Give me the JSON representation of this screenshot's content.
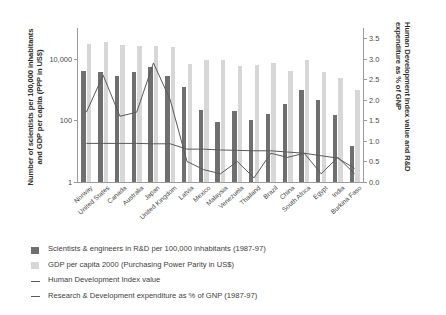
{
  "chart_data": {
    "type": "bar",
    "title": "",
    "xlabel": "",
    "ylabel": "Number of scientists per 100,000 inhabitants and GDP per capita (PPP in US$)",
    "ylabel_right": "Human Development Index value and R&D expenditure as % of GNP",
    "yscale": "log",
    "ylim": [
      1,
      100000
    ],
    "yticks": [
      "1",
      "100",
      "10,000"
    ],
    "ylim_right": [
      0.0,
      3.75
    ],
    "yticks_right": [
      "0.0",
      "0.5",
      "1.0",
      "1.5",
      "2.0",
      "2.5",
      "3.0",
      "3.5"
    ],
    "grid": false,
    "legend_position": "below",
    "categories": [
      "Norway",
      "United States",
      "Canada",
      "Australia",
      "Japan",
      "United Kingdom",
      "Latvia",
      "Mexico",
      "Malaysia",
      "Venezuela",
      "Thailand",
      "Brazil",
      "China",
      "South Africa",
      "Egypt",
      "India",
      "Burkina Faso"
    ],
    "series": [
      {
        "name": "Scientists & engineers in R&D per 100,000 inhabitants (1987-97)",
        "type": "bar",
        "color": "#6f6f6f",
        "axis": "left",
        "values": [
          4100,
          3700,
          2700,
          3600,
          5300,
          2700,
          1200,
          215,
          90,
          200,
          100,
          165,
          350,
          1000,
          460,
          150,
          15
        ]
      },
      {
        "name": "GDP per capita 2000 (Purchasing Power Parity in US$)",
        "type": "bar",
        "color": "#d7d7d7",
        "axis": "left",
        "values": [
          29600,
          34100,
          27800,
          25700,
          26800,
          23500,
          7000,
          9000,
          9000,
          5800,
          6400,
          7300,
          3900,
          9400,
          3600,
          2400,
          1000
        ]
      },
      {
        "name": "Human Development Index value",
        "type": "line",
        "color": "#5a5a5a",
        "axis": "right",
        "values": [
          0.94,
          0.94,
          0.94,
          0.94,
          0.93,
          0.93,
          0.8,
          0.8,
          0.78,
          0.77,
          0.76,
          0.76,
          0.73,
          0.7,
          0.64,
          0.58,
          0.33
        ]
      },
      {
        "name": "Research & Development expenditure as % of GNP (1987-97)",
        "type": "line",
        "color": "#5a5a5a",
        "axis": "right",
        "values": [
          1.7,
          2.6,
          1.6,
          1.7,
          2.9,
          2.0,
          0.5,
          0.3,
          0.2,
          0.5,
          0.1,
          0.7,
          0.6,
          0.7,
          0.2,
          0.6,
          0.2
        ]
      }
    ]
  },
  "legend": {
    "items": [
      {
        "label": "Scientists & engineers in R&D per 100,000 inhabitants (1987-97)",
        "marker": "swatch-dark"
      },
      {
        "label": "GDP per capita 2000 (Purchasing Power Parity in US$)",
        "marker": "swatch-light"
      },
      {
        "label": "Human Development Index value",
        "marker": "line"
      },
      {
        "label": "Research & Development expenditure as % of GNP (1987-97)",
        "marker": "line"
      }
    ]
  }
}
